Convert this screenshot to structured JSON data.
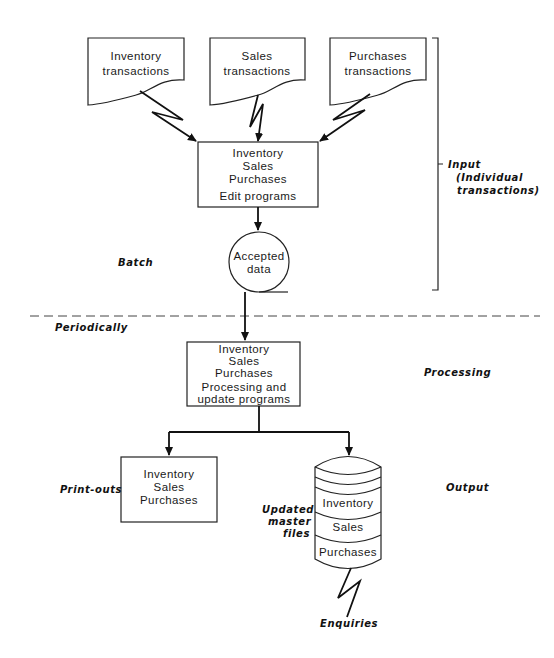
{
  "inputs": [
    {
      "line1": "Inventory",
      "line2": "transactions"
    },
    {
      "line1": "Sales",
      "line2": "transactions"
    },
    {
      "line1": "Purchases",
      "line2": "transactions"
    }
  ],
  "edit_box": {
    "lines": [
      "Inventory",
      "Sales",
      "Purchases"
    ],
    "caption": "Edit programs"
  },
  "accepted": {
    "line1": "Accepted",
    "line2": "data"
  },
  "labels": {
    "batch": "Batch",
    "periodically": "Periodically",
    "input": "Input",
    "input_sub1": "(Individual",
    "input_sub2": "transactions)",
    "processing": "Processing",
    "output": "Output",
    "printouts": "Print-outs",
    "updated1": "Updated",
    "updated2": "master",
    "updated3": "files",
    "enquiries": "Enquiries"
  },
  "process_box": {
    "lines": [
      "Inventory",
      "Sales",
      "Purchases"
    ],
    "caption1": "Processing and",
    "caption2": "update programs"
  },
  "printout_box": {
    "lines": [
      "Inventory",
      "Sales",
      "Purchases"
    ]
  },
  "master_files": [
    "Inventory",
    "Sales",
    "Purchases"
  ]
}
